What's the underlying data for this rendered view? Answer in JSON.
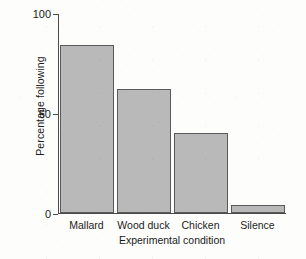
{
  "chart_data": {
    "type": "bar",
    "title": "",
    "xlabel": "Experimental condition",
    "ylabel": "Percentage following",
    "categories": [
      "Mallard",
      "Wood duck",
      "Chicken",
      "Silence"
    ],
    "values": [
      84,
      62,
      40,
      4
    ],
    "ylim": [
      0,
      100
    ],
    "yticks": [
      0,
      50,
      100
    ],
    "ytick_labels": [
      "0",
      "50",
      "100"
    ],
    "grid": false,
    "legend": false,
    "bar_fill_color": "#b9b9b9",
    "bar_edge_color": "#5a5a5a",
    "axis_color": "#4a4a4a",
    "background_color": "#fdfdfb"
  }
}
